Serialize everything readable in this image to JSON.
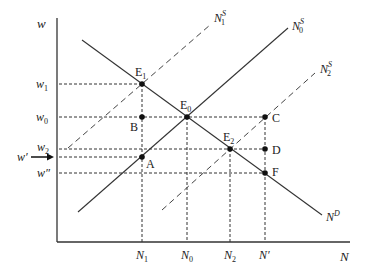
{
  "diagram": {
    "type": "labor-market supply-demand",
    "axes": {
      "y_label": "w",
      "x_label": "N"
    },
    "wage_levels": [
      {
        "id": "w1",
        "base": "w",
        "sub": "1"
      },
      {
        "id": "w0",
        "base": "w",
        "sub": "0"
      },
      {
        "id": "w2",
        "base": "w",
        "sub": "2"
      },
      {
        "id": "wprime",
        "base": "w′",
        "sub": ""
      },
      {
        "id": "wdoubleprime",
        "base": "w″",
        "sub": ""
      }
    ],
    "quantity_levels": [
      {
        "id": "N1",
        "base": "N",
        "sub": "1"
      },
      {
        "id": "N0",
        "base": "N",
        "sub": "0"
      },
      {
        "id": "N2",
        "base": "N",
        "sub": "2"
      },
      {
        "id": "Nprime",
        "base": "N′",
        "sub": ""
      }
    ],
    "curves": [
      {
        "id": "N0S",
        "base": "N",
        "sub": "0",
        "sup": "S",
        "style": "solid"
      },
      {
        "id": "N1S",
        "base": "N",
        "sub": "1",
        "sup": "S",
        "style": "dashed"
      },
      {
        "id": "N2S",
        "base": "N",
        "sub": "2",
        "sup": "S",
        "style": "dashed"
      },
      {
        "id": "ND",
        "base": "N",
        "sub": "",
        "sup": "D",
        "style": "solid"
      }
    ],
    "points": [
      {
        "id": "E1",
        "base": "E",
        "sub": "1"
      },
      {
        "id": "E0",
        "base": "E",
        "sub": "0"
      },
      {
        "id": "E2",
        "base": "E",
        "sub": "2"
      },
      {
        "id": "A",
        "base": "A",
        "sub": ""
      },
      {
        "id": "B",
        "base": "B",
        "sub": ""
      },
      {
        "id": "C",
        "base": "C",
        "sub": ""
      },
      {
        "id": "D",
        "base": "D",
        "sub": ""
      },
      {
        "id": "F",
        "base": "F",
        "sub": ""
      }
    ],
    "arrow_label": "w′"
  }
}
